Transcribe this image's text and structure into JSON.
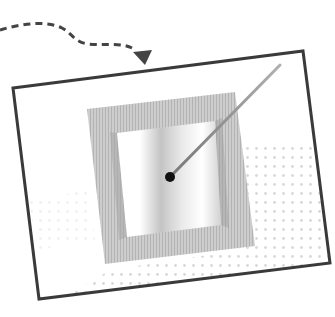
{
  "canvas": {
    "width": 335,
    "height": 317,
    "background": "#ffffff"
  },
  "illustration": {
    "description": "Tilted picture frame containing a square window with a needle pointing to a dot; a dashed curved arrow enters from top-left",
    "colors": {
      "outline": "#3a3a3a",
      "frame_fill": "#c9c9c9",
      "frame_stripe": "#b5b5b5",
      "window_light": "#ffffff",
      "window_shade": "#bdbdbd",
      "dot": "#111111",
      "needle": "#8a8a8a",
      "arrow": "#444444",
      "halftone": "#d6d6d6"
    },
    "outer_frame": {
      "points": [
        [
          13,
          88
        ],
        [
          303,
          51
        ],
        [
          330,
          263
        ],
        [
          39,
          299
        ]
      ],
      "stroke_width": 3
    },
    "inner_frame": {
      "outer_points": [
        [
          87,
          109
        ],
        [
          235,
          92
        ],
        [
          255,
          246
        ],
        [
          105,
          264
        ]
      ],
      "window_points": [
        [
          117,
          133
        ],
        [
          215,
          121
        ],
        [
          221,
          225
        ],
        [
          127,
          237
        ]
      ]
    },
    "dot": {
      "cx": 170,
      "cy": 177,
      "r": 5
    },
    "needle": {
      "x1": 170,
      "y1": 177,
      "x2": 280,
      "y2": 65,
      "width": 3
    },
    "dashed_arrow": {
      "path": "M 0 30 C 20 24, 45 20, 62 28 C 72 33, 74 42, 88 44 C 105 46, 120 42, 132 48",
      "head_tip": [
        145,
        62
      ],
      "dash": "7 5",
      "stroke_width": 3
    }
  }
}
